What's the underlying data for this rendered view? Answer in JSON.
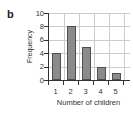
{
  "figure": {
    "panel_label": "b"
  },
  "chart_data": {
    "type": "bar",
    "title": "",
    "categories": [
      "1",
      "2",
      "3",
      "4",
      "5"
    ],
    "values": [
      4,
      8,
      5,
      2,
      1
    ],
    "xlabel": "Number of children",
    "ylabel": "Frequency",
    "ylim": [
      0,
      10
    ],
    "yticks": [
      0,
      2,
      4,
      6,
      8,
      10
    ],
    "grid": true,
    "legend": false,
    "colors": {
      "bar_fill": "#8b8b8b",
      "bar_border": "#4f4f4f",
      "grid": "#cccccc",
      "axis": "#333333",
      "text": "#333333",
      "background": "#ffffff"
    }
  }
}
